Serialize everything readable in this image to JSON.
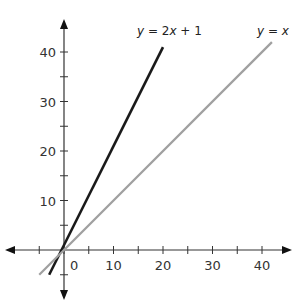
{
  "chart_data": {
    "type": "line",
    "title": "",
    "xlabel": "",
    "ylabel": "",
    "xlim": [
      -9,
      44
    ],
    "ylim": [
      -4,
      47
    ],
    "x_ticks": [
      -5,
      0,
      5,
      10,
      15,
      20,
      25,
      30,
      35,
      40
    ],
    "x_tick_labels": [
      "0",
      "10",
      "20",
      "30",
      "40"
    ],
    "x_tick_label_values": [
      0,
      10,
      20,
      30,
      40
    ],
    "y_ticks": [
      -5,
      5,
      10,
      15,
      20,
      25,
      30,
      35,
      40
    ],
    "y_tick_labels": [
      "10",
      "20",
      "30",
      "40"
    ],
    "y_tick_label_values": [
      10,
      20,
      30,
      40
    ],
    "grid": false,
    "legend": "inline labels at line ends",
    "series": [
      {
        "name": "y = 2x + 1",
        "label_parts": [
          "y",
          " = 2",
          "x",
          " + 1"
        ],
        "color": "#1a1a1a",
        "x": [
          -3,
          20
        ],
        "y": [
          -5,
          41
        ],
        "function": "2x+1"
      },
      {
        "name": "y = x",
        "label_parts": [
          "y",
          " = ",
          "x"
        ],
        "color": "#a0a0a0",
        "x": [
          -5,
          42
        ],
        "y": [
          -5,
          42
        ],
        "function": "x"
      }
    ]
  },
  "axes": {
    "origin_label": "0",
    "color": "#333333"
  }
}
